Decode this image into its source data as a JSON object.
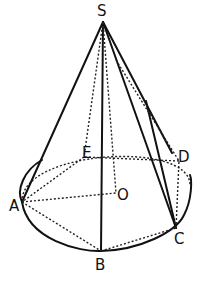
{
  "figure": {
    "labels": {
      "S": "S",
      "A": "A",
      "B": "B",
      "C": "C",
      "D": "D",
      "E": "E",
      "O": "O"
    },
    "points": [
      "S",
      "A",
      "B",
      "C",
      "D",
      "E",
      "O"
    ],
    "solid_segments": [
      [
        "S",
        "A"
      ],
      [
        "S",
        "B"
      ],
      [
        "S",
        "C"
      ],
      [
        "S",
        "D"
      ]
    ],
    "dotted_segments": [
      [
        "S",
        "E"
      ],
      [
        "S",
        "O"
      ],
      [
        "A",
        "O"
      ],
      [
        "A",
        "B"
      ],
      [
        "B",
        "C"
      ],
      [
        "C",
        "D"
      ],
      [
        "D",
        "E"
      ],
      [
        "E",
        "A"
      ]
    ],
    "base": "circle"
  }
}
